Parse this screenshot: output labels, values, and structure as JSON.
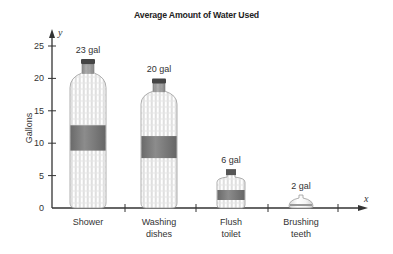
{
  "chart_data": {
    "type": "bar",
    "style": "pictograph-bottles",
    "title": "Average Amount of Water Used",
    "xlabel": "x",
    "ylabel": "Gallons",
    "y_axis_variable": "y",
    "categories": [
      "Shower",
      "Washing dishes",
      "Flush toilet",
      "Brushing teeth"
    ],
    "category_lines": [
      [
        "Shower"
      ],
      [
        "Washing",
        "dishes"
      ],
      [
        "Flush",
        "toilet"
      ],
      [
        "Brushing",
        "teeth"
      ]
    ],
    "values": [
      23,
      20,
      6,
      2
    ],
    "data_labels": [
      "23 gal",
      "20 gal",
      "6 gal",
      "2 gal"
    ],
    "unit": "gal",
    "ylim": [
      0,
      25
    ],
    "yticks": [
      0,
      5,
      10,
      15,
      20,
      25
    ],
    "grid": false,
    "legend": null
  },
  "colors": {
    "axis": "#333333",
    "bottle_outline": "#9a9a9a",
    "bottle_band": "#7a7a7a",
    "cap": "#555555"
  }
}
